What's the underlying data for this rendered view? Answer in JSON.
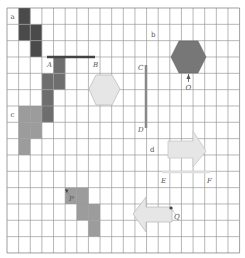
{
  "diagram": {
    "grid": {
      "cols": 20,
      "rows": 15,
      "x0": 7,
      "y0": 8,
      "cell_w": 11.63,
      "cell_h": 16.33,
      "line_color": "#9a9a9a",
      "border_color": "#777777"
    },
    "colors": {
      "dark": "#4a4a4a",
      "medium": "#6e6e6e",
      "light": "#9c9c9c",
      "pale": "#e6e6e6",
      "pale_stroke": "#bdbdbd",
      "line_dark": "#444444",
      "line_mid": "#888888",
      "line_pale": "#dedede"
    },
    "labels": {
      "a": "a",
      "b": "b",
      "c": "c",
      "d": "d",
      "A": "A",
      "B": "B",
      "C": "C",
      "D": "D",
      "E": "E",
      "F": "F",
      "O": "O",
      "P": "P",
      "Q": "Q"
    },
    "shapes": [
      {
        "id": "shape-a",
        "color": "dark",
        "cells": [
          [
            1,
            0
          ],
          [
            1,
            1
          ],
          [
            2,
            1
          ],
          [
            2,
            2
          ]
        ]
      },
      {
        "id": "shape-A",
        "color": "medium",
        "cells": [
          [
            4,
            3
          ],
          [
            3,
            4
          ],
          [
            4,
            4
          ],
          [
            3,
            5
          ],
          [
            3,
            6
          ]
        ]
      },
      {
        "id": "shape-c",
        "color": "light",
        "cells": [
          [
            1,
            6
          ],
          [
            2,
            6
          ],
          [
            1,
            7
          ],
          [
            2,
            7
          ],
          [
            1,
            8
          ]
        ]
      },
      {
        "id": "shape-P",
        "color": "light",
        "cells": [
          [
            5,
            11
          ],
          [
            6,
            11
          ],
          [
            6,
            12
          ],
          [
            7,
            12
          ],
          [
            7,
            13
          ]
        ]
      }
    ],
    "segments": [
      {
        "id": "segment-AB",
        "from": "A",
        "to": "B",
        "x1": 47,
        "y1": 57,
        "x2": 95,
        "y2": 57,
        "color": "line_dark",
        "width": 2.5
      },
      {
        "id": "segment-CD",
        "from": "C",
        "to": "D",
        "x1": 146,
        "y1": 65,
        "x2": 146,
        "y2": 128,
        "color": "line_mid",
        "width": 2.5
      },
      {
        "id": "segment-EF",
        "from": "E",
        "to": "F",
        "x1": 162,
        "y1": 172,
        "x2": 210,
        "y2": 172,
        "color": "line_pale",
        "width": 2.5
      }
    ]
  }
}
